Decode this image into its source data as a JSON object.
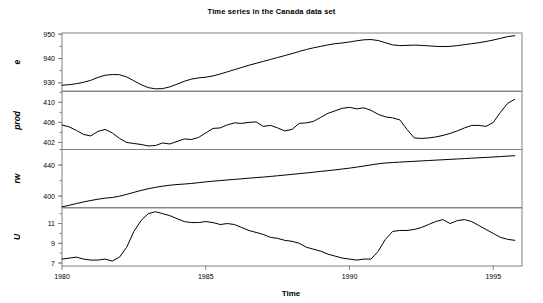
{
  "chart_data": {
    "type": "line",
    "title": "Time series in the Canada data set",
    "xlabel": "Time",
    "ylabel": "",
    "grid": false,
    "legend": "none",
    "layout": "4 stacked panels sharing one x axis",
    "xlim": [
      1980,
      1996
    ],
    "xticks": [
      1980,
      1985,
      1990,
      1995
    ],
    "xticklabels": [
      "1980",
      "1985",
      "1990",
      "1995"
    ],
    "panels": [
      {
        "name": "e",
        "label": "e",
        "ylim": [
          926.5,
          950.5
        ],
        "yticks": [
          930,
          940,
          950
        ],
        "yticklabels": [
          "930",
          "940",
          "950"
        ],
        "x": [
          1980.0,
          1980.25,
          1980.5,
          1980.75,
          1981.0,
          1981.25,
          1981.5,
          1981.75,
          1982.0,
          1982.25,
          1982.5,
          1982.75,
          1983.0,
          1983.25,
          1983.5,
          1983.75,
          1984.0,
          1984.25,
          1984.5,
          1984.75,
          1985.0,
          1985.25,
          1985.5,
          1985.75,
          1986.0,
          1986.25,
          1986.5,
          1986.75,
          1987.0,
          1987.25,
          1987.5,
          1987.75,
          1988.0,
          1988.25,
          1988.5,
          1988.75,
          1989.0,
          1989.25,
          1989.5,
          1989.75,
          1990.0,
          1990.25,
          1990.5,
          1990.75,
          1991.0,
          1991.25,
          1991.5,
          1991.75,
          1992.0,
          1992.25,
          1992.5,
          1992.75,
          1993.0,
          1993.25,
          1993.5,
          1993.75,
          1994.0,
          1994.25,
          1994.5,
          1994.75,
          1995.0,
          1995.25,
          1995.5,
          1995.75
        ],
        "values": [
          929.0,
          929.2,
          929.6,
          930.2,
          931.0,
          932.2,
          933.1,
          933.4,
          933.3,
          932.4,
          930.8,
          929.2,
          928.0,
          927.5,
          927.6,
          928.3,
          929.4,
          930.6,
          931.5,
          932.0,
          932.3,
          932.8,
          933.6,
          934.5,
          935.4,
          936.3,
          937.2,
          938.0,
          938.8,
          939.6,
          940.4,
          941.2,
          942.0,
          942.9,
          943.7,
          944.4,
          945.0,
          945.6,
          946.1,
          946.4,
          946.8,
          947.3,
          947.7,
          947.8,
          947.4,
          946.5,
          945.6,
          945.3,
          945.4,
          945.5,
          945.4,
          945.2,
          945.0,
          944.9,
          945.0,
          945.3,
          945.7,
          946.1,
          946.5,
          947.0,
          947.6,
          948.3,
          949.0,
          949.4
        ]
      },
      {
        "name": "prod",
        "label": "prod",
        "ylim": [
          400.6,
          412.2
        ],
        "yticks": [
          402,
          406,
          410
        ],
        "yticklabels": [
          "402",
          "406",
          "410"
        ],
        "x": [
          1980.0,
          1980.25,
          1980.5,
          1980.75,
          1981.0,
          1981.25,
          1981.5,
          1981.75,
          1982.0,
          1982.25,
          1982.5,
          1982.75,
          1983.0,
          1983.25,
          1983.5,
          1983.75,
          1984.0,
          1984.25,
          1984.5,
          1984.75,
          1985.0,
          1985.25,
          1985.5,
          1985.75,
          1986.0,
          1986.25,
          1986.5,
          1986.75,
          1987.0,
          1987.25,
          1987.5,
          1987.75,
          1988.0,
          1988.25,
          1988.5,
          1988.75,
          1989.0,
          1989.25,
          1989.5,
          1989.75,
          1990.0,
          1990.25,
          1990.5,
          1990.75,
          1991.0,
          1991.25,
          1991.5,
          1991.75,
          1992.0,
          1992.25,
          1992.5,
          1992.75,
          1993.0,
          1993.25,
          1993.5,
          1993.75,
          1994.0,
          1994.25,
          1994.5,
          1994.75,
          1995.0,
          1995.25,
          1995.5,
          1995.75
        ],
        "values": [
          405.5,
          405.1,
          404.4,
          403.6,
          403.3,
          404.2,
          404.6,
          403.9,
          402.8,
          402.0,
          401.8,
          401.6,
          401.3,
          401.4,
          401.9,
          401.7,
          402.2,
          402.7,
          402.6,
          403.0,
          403.9,
          404.8,
          404.9,
          405.5,
          405.9,
          405.8,
          406.0,
          406.1,
          405.2,
          405.4,
          404.9,
          404.3,
          404.6,
          405.8,
          405.9,
          406.2,
          407.0,
          407.8,
          408.3,
          408.8,
          409.0,
          408.7,
          408.9,
          408.4,
          407.6,
          407.1,
          406.9,
          406.5,
          404.6,
          402.9,
          402.8,
          402.9,
          403.1,
          403.4,
          403.8,
          404.3,
          404.9,
          405.4,
          405.4,
          405.2,
          406.0,
          408.0,
          409.8,
          410.6
        ]
      },
      {
        "name": "rw",
        "label": "rw",
        "ylim": [
          385.0,
          460.0
        ],
        "yticks": [
          400,
          440
        ],
        "yticklabels": [
          "400",
          "440"
        ],
        "x": [
          1980.0,
          1980.25,
          1980.5,
          1980.75,
          1981.0,
          1981.25,
          1981.5,
          1981.75,
          1982.0,
          1982.25,
          1982.5,
          1982.75,
          1983.0,
          1983.25,
          1983.5,
          1983.75,
          1984.0,
          1984.25,
          1984.5,
          1984.75,
          1985.0,
          1985.25,
          1985.5,
          1985.75,
          1986.0,
          1986.25,
          1986.5,
          1986.75,
          1987.0,
          1987.25,
          1987.5,
          1987.75,
          1988.0,
          1988.25,
          1988.5,
          1988.75,
          1989.0,
          1989.25,
          1989.5,
          1989.75,
          1990.0,
          1990.25,
          1990.5,
          1990.75,
          1991.0,
          1991.25,
          1991.5,
          1991.75,
          1992.0,
          1992.25,
          1992.5,
          1992.75,
          1993.0,
          1993.25,
          1993.5,
          1993.75,
          1994.0,
          1994.25,
          1994.5,
          1994.75,
          1995.0,
          1995.25,
          1995.5,
          1995.75
        ],
        "values": [
          386.1,
          388.2,
          390.4,
          392.5,
          394.3,
          396.0,
          397.4,
          398.2,
          399.9,
          402.2,
          404.8,
          407.3,
          409.5,
          411.3,
          412.8,
          414.0,
          414.9,
          415.5,
          416.3,
          417.3,
          418.3,
          419.2,
          420.0,
          420.8,
          421.5,
          422.3,
          423.1,
          423.8,
          424.5,
          425.3,
          426.2,
          427.1,
          428.0,
          428.9,
          429.8,
          430.8,
          431.8,
          432.8,
          433.8,
          434.9,
          436.0,
          437.3,
          438.7,
          440.2,
          441.6,
          442.6,
          443.2,
          443.8,
          444.3,
          444.8,
          445.3,
          445.8,
          446.3,
          446.8,
          447.3,
          447.8,
          448.3,
          448.8,
          449.3,
          449.8,
          450.3,
          450.9,
          451.5,
          452.0
        ]
      },
      {
        "name": "U",
        "label": "U",
        "ylim": [
          6.7,
          12.6
        ],
        "yticks": [
          7,
          9,
          11
        ],
        "yticklabels": [
          "7",
          "9",
          "11"
        ],
        "x": [
          1980.0,
          1980.25,
          1980.5,
          1980.75,
          1981.0,
          1981.25,
          1981.5,
          1981.75,
          1982.0,
          1982.25,
          1982.5,
          1982.75,
          1983.0,
          1983.25,
          1983.5,
          1983.75,
          1984.0,
          1984.25,
          1984.5,
          1984.75,
          1985.0,
          1985.25,
          1985.5,
          1985.75,
          1986.0,
          1986.25,
          1986.5,
          1986.75,
          1987.0,
          1987.25,
          1987.5,
          1987.75,
          1988.0,
          1988.25,
          1988.5,
          1988.75,
          1989.0,
          1989.25,
          1989.5,
          1989.75,
          1990.0,
          1990.25,
          1990.5,
          1990.75,
          1991.0,
          1991.25,
          1991.5,
          1991.75,
          1992.0,
          1992.25,
          1992.5,
          1992.75,
          1993.0,
          1993.25,
          1993.5,
          1993.75,
          1994.0,
          1994.25,
          1994.5,
          1994.75,
          1995.0,
          1995.25,
          1995.5,
          1995.75
        ],
        "values": [
          7.4,
          7.5,
          7.6,
          7.4,
          7.3,
          7.3,
          7.4,
          7.2,
          7.6,
          8.6,
          10.2,
          11.3,
          12.0,
          12.2,
          12.0,
          11.8,
          11.5,
          11.2,
          11.1,
          11.1,
          11.2,
          11.1,
          10.9,
          11.0,
          10.9,
          10.6,
          10.3,
          10.1,
          9.9,
          9.6,
          9.5,
          9.3,
          9.2,
          9.0,
          8.6,
          8.4,
          8.2,
          7.9,
          7.7,
          7.5,
          7.4,
          7.3,
          7.4,
          7.4,
          8.2,
          9.4,
          10.2,
          10.3,
          10.3,
          10.4,
          10.6,
          10.9,
          11.2,
          11.4,
          11.0,
          11.3,
          11.4,
          11.2,
          10.8,
          10.4,
          10.0,
          9.6,
          9.4,
          9.3
        ]
      }
    ]
  }
}
